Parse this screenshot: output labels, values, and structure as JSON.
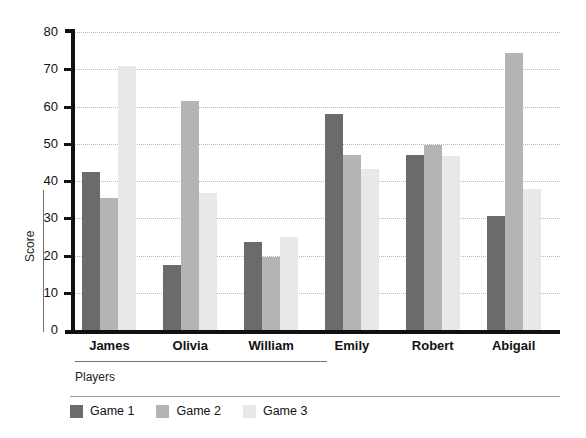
{
  "chart_data": {
    "type": "bar",
    "title": "",
    "xlabel": "Players",
    "ylabel": "Score",
    "categories": [
      "James",
      "Olivia",
      "William",
      "Emily",
      "Robert",
      "Abigail"
    ],
    "series": [
      {
        "name": "Game 1",
        "color": "#6b6b6b",
        "values": [
          42.5,
          17.5,
          23.7,
          58.0,
          47.0,
          30.7
        ]
      },
      {
        "name": "Game 2",
        "color": "#b4b4b4",
        "values": [
          35.5,
          61.5,
          19.6,
          47.0,
          49.6,
          74.5
        ]
      },
      {
        "name": "Game 3",
        "color": "#e8e8e8",
        "values": [
          70.8,
          36.8,
          25.1,
          43.3,
          46.8,
          37.8
        ]
      }
    ],
    "ylim": [
      0,
      80
    ],
    "yticks": [
      0,
      10,
      20,
      30,
      40,
      50,
      60,
      70,
      80
    ],
    "ytick_labels": [
      "0",
      "10",
      "20",
      "30",
      "40",
      "50",
      "60",
      "70",
      "80"
    ],
    "grid": true,
    "grid_style": "dotted",
    "grid_axis": "y",
    "legend_position": "bottom-left",
    "bar_orientation": "vertical",
    "background": "#ffffff",
    "axis_color": "#111111"
  }
}
